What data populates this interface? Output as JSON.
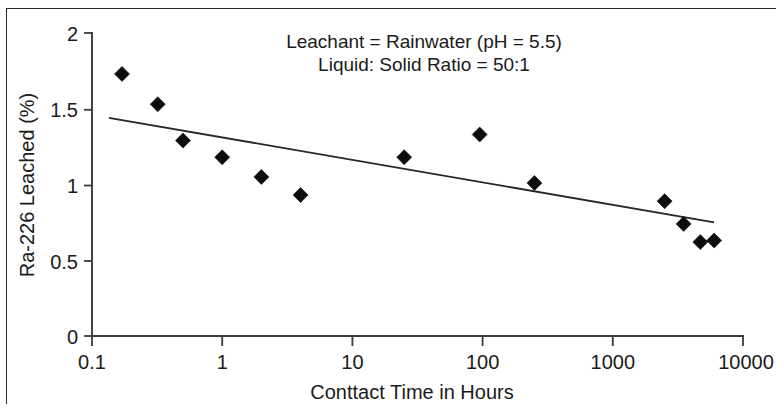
{
  "figure": {
    "background_color": "#ffffff",
    "ink_color": "#1a1a1a",
    "marker_color": "#0d0d0d",
    "border_color": "#2b2b2b"
  },
  "annotations": {
    "line1": "Leachant = Rainwater (pH = 5.5)",
    "line2": "Liquid: Solid Ratio = 50:1"
  },
  "axes": {
    "x_title": "Conttact Time in Hours",
    "y_title": "Ra-226 Leached (%)",
    "x_ticks": [
      "0.1",
      "1",
      "10",
      "100",
      "1000",
      "10000"
    ],
    "y_ticks": [
      "0",
      "0.5",
      "1",
      "1.5",
      "2"
    ]
  },
  "chart_data": {
    "type": "scatter",
    "title": "",
    "subtitle": "",
    "xlabel": "Conttact Time in Hours",
    "ylabel": "Ra-226 Leached (%)",
    "xscale": "log",
    "yscale": "linear",
    "xlim": [
      0.1,
      10000
    ],
    "ylim": [
      0,
      2
    ],
    "xticks": [
      0.1,
      1,
      10,
      100,
      1000,
      10000
    ],
    "xticklabels": [
      "0.1",
      "1",
      "10",
      "100",
      "1000",
      "10000"
    ],
    "yticks": [
      0,
      0.5,
      1,
      1.5,
      2
    ],
    "yticklabels": [
      "0",
      "0.5",
      "1",
      "1.5",
      "2"
    ],
    "grid": false,
    "legend": false,
    "legend_position": "none",
    "marker_style": "filled-diamond",
    "series": [
      {
        "name": "Ra-226 Leached",
        "marker": "diamond",
        "points": [
          {
            "x": 0.17,
            "y": 1.73
          },
          {
            "x": 0.32,
            "y": 1.53
          },
          {
            "x": 0.5,
            "y": 1.29
          },
          {
            "x": 1.0,
            "y": 1.18
          },
          {
            "x": 2.0,
            "y": 1.05
          },
          {
            "x": 4.0,
            "y": 0.93
          },
          {
            "x": 25.0,
            "y": 1.18
          },
          {
            "x": 95.0,
            "y": 1.33
          },
          {
            "x": 250.0,
            "y": 1.01
          },
          {
            "x": 2500.0,
            "y": 0.89
          },
          {
            "x": 3500.0,
            "y": 0.74
          },
          {
            "x": 4700.0,
            "y": 0.62
          },
          {
            "x": 6000.0,
            "y": 0.63
          }
        ]
      },
      {
        "name": "Linear trend (log x)",
        "type": "line",
        "points": [
          {
            "x": 0.135,
            "y": 1.44
          },
          {
            "x": 6000.0,
            "y": 0.75
          }
        ]
      }
    ],
    "annotations": [
      {
        "text": "Leachant = Rainwater (pH = 5.5)",
        "x": 30,
        "y": 1.88
      },
      {
        "text": "Liquid: Solid Ratio = 50:1",
        "x": 30,
        "y": 1.74
      }
    ]
  }
}
